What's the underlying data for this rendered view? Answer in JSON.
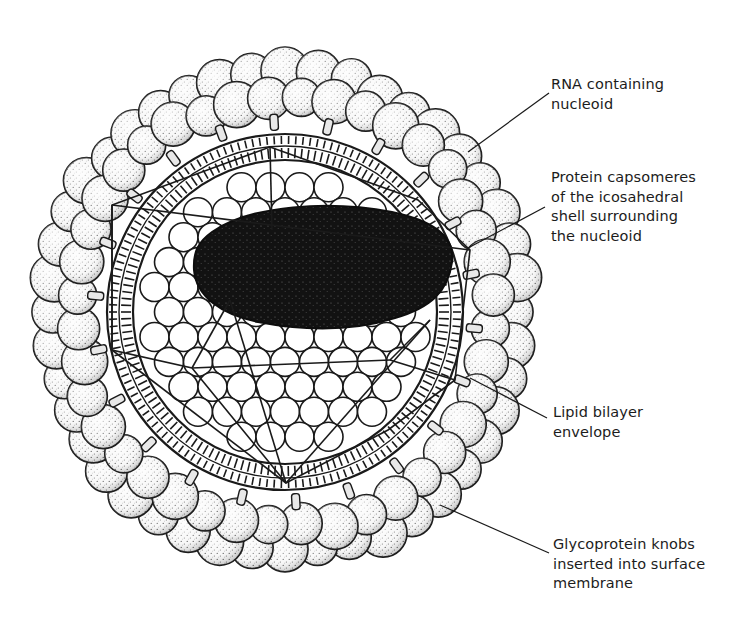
{
  "figure": {
    "colors": {
      "ink": "#1a1a1a",
      "paper": "#ffffff",
      "knob_fill": "#f4f4f4",
      "stipple": "#2a2a2a",
      "nucleoid": "#111111"
    },
    "labels": [
      {
        "id": "rna-nucleoid",
        "lines": [
          "RNA containing",
          "nucleoid"
        ],
        "text": "RNA containing nucleoid"
      },
      {
        "id": "protein-capsomeres",
        "lines": [
          "Protein capsomeres",
          "of the icosahedral",
          "shell surrounding",
          "the nucleoid"
        ],
        "text": "Protein capsomeres of the icosahedral shell surrounding the nucleoid"
      },
      {
        "id": "lipid-bilayer",
        "lines": [
          "Lipid bilayer",
          "envelope"
        ],
        "text": "Lipid bilayer envelope"
      },
      {
        "id": "glycoprotein-knobs",
        "lines": [
          "Glycoprotein knobs",
          "inserted into surface",
          "membrane"
        ],
        "text": "Glycoprotein knobs inserted into surface membrane"
      }
    ]
  }
}
